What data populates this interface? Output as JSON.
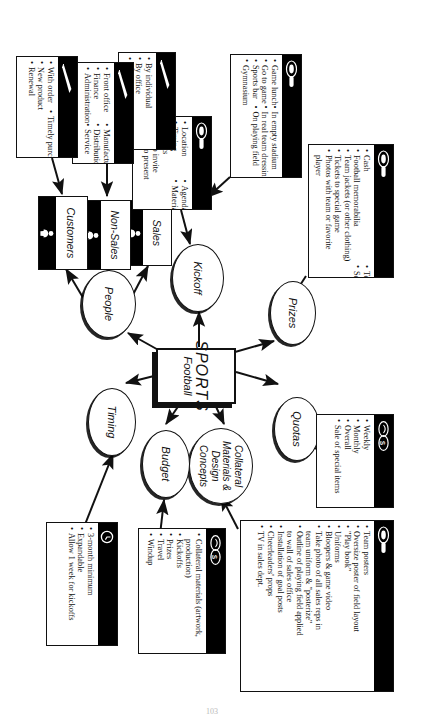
{
  "document": {
    "page_number": "103"
  },
  "root": {
    "line1": "SPORTS",
    "line2": "Football"
  },
  "nodes": {
    "prizes": "Prizes",
    "quotas": "Quotas",
    "collateral": "Collateral Materials & Design Concepts",
    "budget": "Budget",
    "timing": "Timing",
    "people": "People",
    "kickoff": "Kickoff"
  },
  "people_children": [
    {
      "key": "sales",
      "label": "Sales",
      "icon": "person-icon"
    },
    {
      "key": "non_sales",
      "label": "Non-Sales",
      "icon": "person-icon"
    },
    {
      "key": "customers",
      "label": "Customers",
      "icon": "person-icon"
    }
  ],
  "details": {
    "prizes": {
      "icon": "trophy-icon",
      "items": [
        "Cash",
        "Football memorabilia",
        "Team jackets (or other clothing)",
        "Tickets to special game",
        "Photos with team or favorite player",
        "Team ring",
        "Season's tickets"
      ]
    },
    "quotas": {
      "icon": "money-icon",
      "items": [
        "Weekly",
        "Monthly",
        "Overall",
        "Sale of special items"
      ]
    },
    "collateral": {
      "icon": "trophy-icon",
      "items": [
        "Team posters",
        "Oversize poster of field layout",
        "\"Play book\"",
        "Uniforms",
        "Bloopers & game video",
        "Take photo of all sales reps in team uniform & \"posterize\"",
        "Outline of playing field applied to wall of sales office",
        "Installation of goal posts",
        "Cheerleaders' props",
        "TV in sales dept."
      ]
    },
    "budget": {
      "icon": "money-icon",
      "items": [
        "Collateral materials (artwork, production)",
        "Kickoffs",
        "Prizes",
        "Travel",
        "Windup"
      ]
    },
    "timing": {
      "icon": "clock-icon",
      "items": [
        "3-month minimum",
        "Expandable",
        "Allow 1 week for kickoffs"
      ]
    },
    "kickoff_agenda": {
      "icon": "trophy-icon",
      "items": [
        "Location",
        "Timing",
        "Budgets",
        "Who to invite",
        "What to present",
        "Agenda",
        "Materials required"
      ]
    },
    "kickoff_venue": {
      "icon": "trophy-icon",
      "items": [
        "Game lunch",
        "Go to game",
        "Sports bar",
        "Gymnasium",
        "In empty stadium",
        "In real team dressing room",
        "On playing field"
      ]
    },
    "sales": {
      "icon": "pen-icon",
      "items": [
        "By individual",
        "By office",
        "By region"
      ]
    },
    "non_sales": {
      "icon": "pen-icon",
      "items": [
        "Front office",
        "Finance",
        "Administration",
        "Manufacturing",
        "Distribution",
        "Service"
      ]
    },
    "customers": {
      "icon": "pen-icon",
      "items": [
        "With order",
        "New product",
        "Renewal",
        "Timely purchase"
      ]
    }
  },
  "colors": {
    "ink": "#111111",
    "strip": "#000000",
    "paper": "#ffffff"
  }
}
